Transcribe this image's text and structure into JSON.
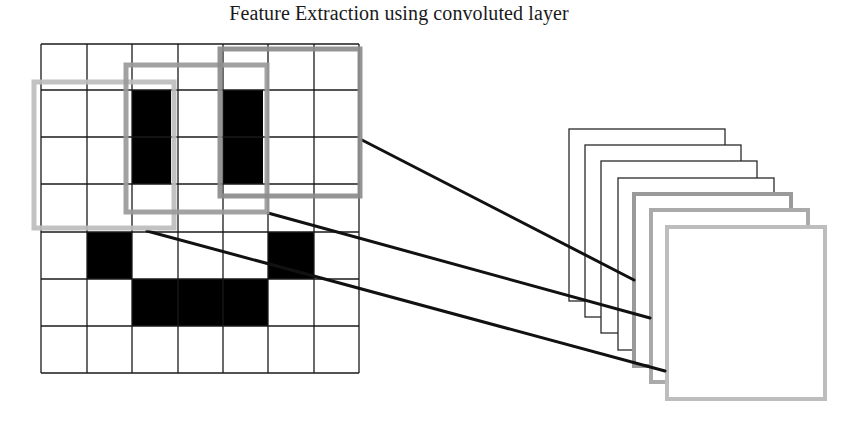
{
  "title": "Feature Extraction using convoluted layer",
  "colors": {
    "grid_line": "#1a1a1a",
    "filled_cell": "#000000",
    "background": "#ffffff",
    "connector": "#111111"
  },
  "input_grid": {
    "rows": 7,
    "cols": 7,
    "x_lines": [
      41,
      87,
      132,
      178,
      223,
      268,
      314,
      359
    ],
    "y_lines": [
      44,
      90,
      137,
      184,
      232,
      279,
      326,
      373
    ],
    "filled_cells": [
      {
        "row": 1,
        "col": 2,
        "rowspan": 2,
        "colspan": 1,
        "inset_right": 7
      },
      {
        "row": 1,
        "col": 4,
        "rowspan": 2,
        "colspan": 1,
        "inset_right": 5
      },
      {
        "row": 4,
        "col": 1,
        "rowspan": 1,
        "colspan": 1
      },
      {
        "row": 4,
        "col": 5,
        "rowspan": 1,
        "colspan": 1
      },
      {
        "row": 5,
        "col": 2,
        "rowspan": 1,
        "colspan": 3
      }
    ]
  },
  "filter_windows": [
    {
      "name": "filter-window-1",
      "x": 34,
      "y": 82,
      "w": 140,
      "h": 146,
      "stroke": "#bdbdbd",
      "width": 5
    },
    {
      "name": "filter-window-2",
      "x": 126,
      "y": 65,
      "w": 141,
      "h": 147,
      "stroke": "#9a9a9a",
      "width": 5
    },
    {
      "name": "filter-window-3",
      "x": 220,
      "y": 49,
      "w": 140,
      "h": 147,
      "stroke": "#8c8c8c",
      "width": 5
    }
  ],
  "connectors": [
    {
      "name": "connector-line-1",
      "x1": 362,
      "y1": 140,
      "x2": 634,
      "y2": 280
    },
    {
      "name": "connector-line-2",
      "x1": 268,
      "y1": 213,
      "x2": 650,
      "y2": 318
    },
    {
      "name": "connector-line-3",
      "x1": 147,
      "y1": 231,
      "x2": 665,
      "y2": 371
    }
  ],
  "feature_maps": [
    {
      "name": "feature-map-1",
      "x": 569,
      "y": 129,
      "w": 156,
      "h": 172,
      "stroke": "#2a2a2a",
      "width": 1.3
    },
    {
      "name": "feature-map-2",
      "x": 585,
      "y": 145,
      "w": 156,
      "h": 172,
      "stroke": "#2a2a2a",
      "width": 1.3
    },
    {
      "name": "feature-map-3",
      "x": 601,
      "y": 161,
      "w": 156,
      "h": 172,
      "stroke": "#2a2a2a",
      "width": 1.3
    },
    {
      "name": "feature-map-4",
      "x": 618,
      "y": 178,
      "w": 156,
      "h": 172,
      "stroke": "#2a2a2a",
      "width": 1.3
    },
    {
      "name": "feature-map-5",
      "x": 634,
      "y": 194,
      "w": 157,
      "h": 172,
      "stroke": "#9a9a9a",
      "width": 4
    },
    {
      "name": "feature-map-6",
      "x": 651,
      "y": 210,
      "w": 157,
      "h": 172,
      "stroke": "#aaaaaa",
      "width": 4
    },
    {
      "name": "feature-map-7",
      "x": 667,
      "y": 227,
      "w": 158,
      "h": 172,
      "stroke": "#bdbdbd",
      "width": 4
    }
  ]
}
